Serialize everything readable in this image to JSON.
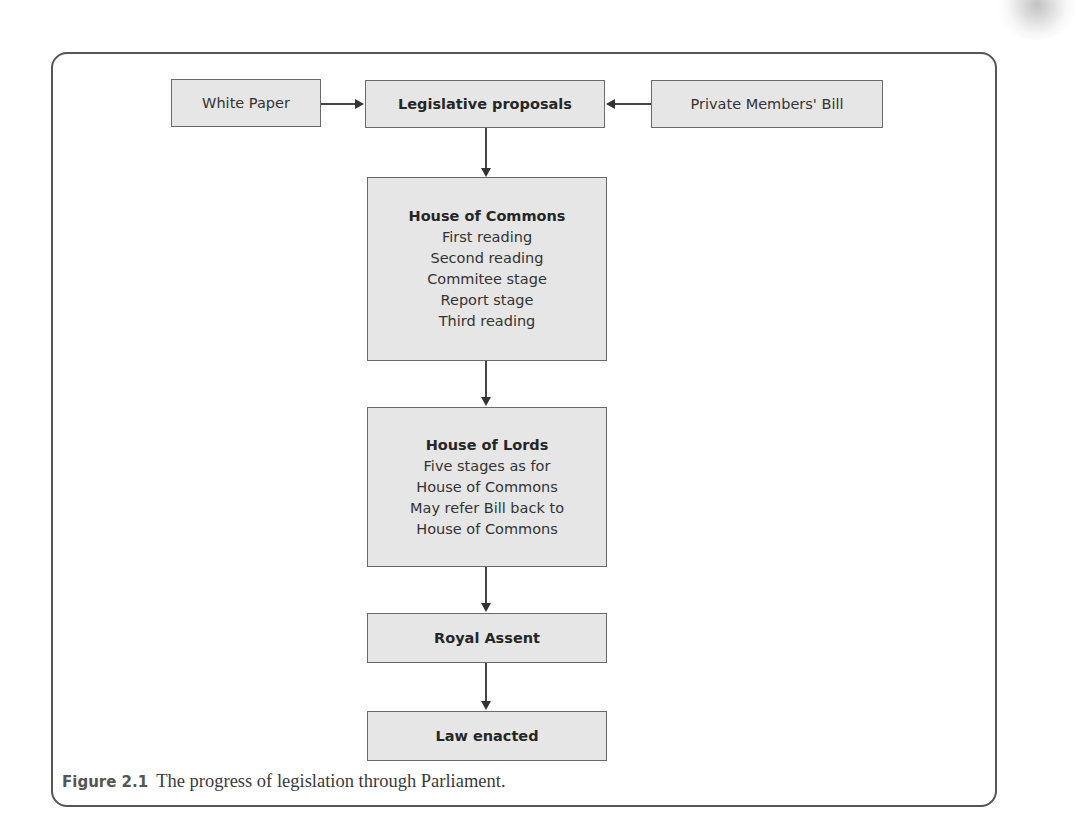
{
  "diagram": {
    "type": "flowchart",
    "inputs": [
      {
        "id": "white_paper",
        "label": "White Paper"
      },
      {
        "id": "private_members_bill",
        "label": "Private Members' Bill"
      }
    ],
    "nodes": {
      "legislative_proposals": {
        "title": "Legislative proposals",
        "lines": []
      },
      "house_of_commons": {
        "title": "House of Commons",
        "lines": [
          "First reading",
          "Second reading",
          "Commitee stage",
          "Report stage",
          "Third reading"
        ]
      },
      "house_of_lords": {
        "title": "House of Lords",
        "lines": [
          "Five stages as for",
          "House of Commons",
          "May refer Bill back to",
          "House of Commons"
        ]
      },
      "royal_assent": {
        "title": "Royal Assent",
        "lines": []
      },
      "law_enacted": {
        "title": "Law enacted",
        "lines": []
      }
    },
    "edges": [
      {
        "from": "White Paper",
        "to": "Legislative proposals"
      },
      {
        "from": "Private Members' Bill",
        "to": "Legislative proposals"
      },
      {
        "from": "Legislative proposals",
        "to": "House of Commons"
      },
      {
        "from": "House of Commons",
        "to": "House of Lords"
      },
      {
        "from": "House of Lords",
        "to": "Royal Assent"
      },
      {
        "from": "Royal Assent",
        "to": "Law enacted"
      }
    ]
  },
  "caption": {
    "label": "Figure 2.1",
    "text": "The progress of legislation through Parliament."
  },
  "colors": {
    "box_fill": "#e6e6e6",
    "box_border": "#6a6a6a",
    "arrow": "#333333",
    "frame": "#555555"
  }
}
